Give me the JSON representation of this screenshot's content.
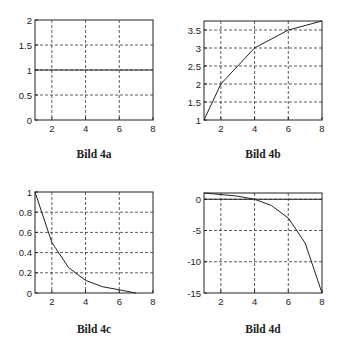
{
  "chart_data": [
    {
      "type": "line",
      "id": "4a",
      "caption": "Bild 4a",
      "x": [
        1,
        2,
        3,
        4,
        5,
        6,
        7,
        8
      ],
      "series": [
        {
          "name": "y",
          "values": [
            1,
            1,
            1,
            1,
            1,
            1,
            1,
            1
          ]
        }
      ],
      "xlim": [
        1,
        8
      ],
      "ylim": [
        0,
        2
      ],
      "xticks": [
        2,
        4,
        6,
        8
      ],
      "xtick_labels": [
        "2",
        "4",
        "6",
        "8"
      ],
      "yticks": [
        0,
        0.5,
        1,
        1.5,
        2
      ],
      "ytick_labels": [
        "0",
        "0.5",
        "1",
        "1.5",
        "2"
      ],
      "grid": true,
      "xlabel": "",
      "ylabel": "",
      "title": ""
    },
    {
      "type": "line",
      "id": "4b",
      "caption": "Bild 4b",
      "x": [
        1,
        2,
        3,
        4,
        5,
        6,
        7,
        8
      ],
      "series": [
        {
          "name": "y",
          "values": [
            1,
            2,
            2.5,
            3,
            3.25,
            3.5,
            3.625,
            3.75
          ]
        }
      ],
      "xlim": [
        1,
        8
      ],
      "ylim": [
        1,
        3.75
      ],
      "xticks": [
        2,
        4,
        6,
        8
      ],
      "xtick_labels": [
        "2",
        "4",
        "6",
        "8"
      ],
      "yticks": [
        1,
        1.5,
        2,
        2.5,
        3,
        3.5
      ],
      "ytick_labels": [
        "1",
        "1.5",
        "2",
        "2.5",
        "3",
        "3.5"
      ],
      "grid": true,
      "xlabel": "",
      "ylabel": "",
      "title": ""
    },
    {
      "type": "line",
      "id": "4c",
      "caption": "Bild 4c",
      "x": [
        1,
        2,
        3,
        4,
        5,
        6,
        7
      ],
      "series": [
        {
          "name": "y",
          "values": [
            1,
            0.5,
            0.25,
            0.125,
            0.0625,
            0.03125,
            0
          ]
        }
      ],
      "xlim": [
        1,
        8
      ],
      "ylim": [
        0,
        1
      ],
      "xticks": [
        2,
        4,
        6,
        8
      ],
      "xtick_labels": [
        "2",
        "4",
        "6",
        "8"
      ],
      "yticks": [
        0,
        0.2,
        0.4,
        0.6,
        0.8,
        1
      ],
      "ytick_labels": [
        "0",
        "0.2",
        "0.4",
        "0.6",
        "0.8",
        "1"
      ],
      "grid": true,
      "xlabel": "",
      "ylabel": "",
      "title": ""
    },
    {
      "type": "line",
      "id": "4d",
      "caption": "Bild 4d",
      "x": [
        1,
        2,
        3,
        4,
        5,
        6,
        7,
        8
      ],
      "series": [
        {
          "name": "y",
          "values": [
            1,
            0.75,
            0.5,
            0,
            -1,
            -3,
            -7,
            -15
          ]
        },
        {
          "name": "zero-line",
          "values": [
            0,
            0,
            0,
            0,
            0,
            0,
            0,
            0
          ]
        }
      ],
      "xlim": [
        1,
        8
      ],
      "ylim": [
        -15,
        1
      ],
      "xticks": [
        2,
        4,
        6,
        8
      ],
      "xtick_labels": [
        "2",
        "4",
        "6",
        "8"
      ],
      "yticks": [
        -15,
        -10,
        -5,
        0
      ],
      "ytick_labels": [
        "-15",
        "-10",
        "-5",
        "0"
      ],
      "grid": true,
      "xlabel": "",
      "ylabel": "",
      "title": ""
    }
  ],
  "layout": [
    {
      "left": 35,
      "top": 20,
      "width": 118,
      "height": 100,
      "caption_x": 34,
      "caption_y": 148
    },
    {
      "left": 204,
      "top": 21,
      "width": 118,
      "height": 99,
      "caption_x": 203,
      "caption_y": 148
    },
    {
      "left": 35,
      "top": 192,
      "width": 118,
      "height": 101,
      "caption_x": 34,
      "caption_y": 323
    },
    {
      "left": 204,
      "top": 193,
      "width": 118,
      "height": 100,
      "caption_x": 203,
      "caption_y": 323
    }
  ]
}
